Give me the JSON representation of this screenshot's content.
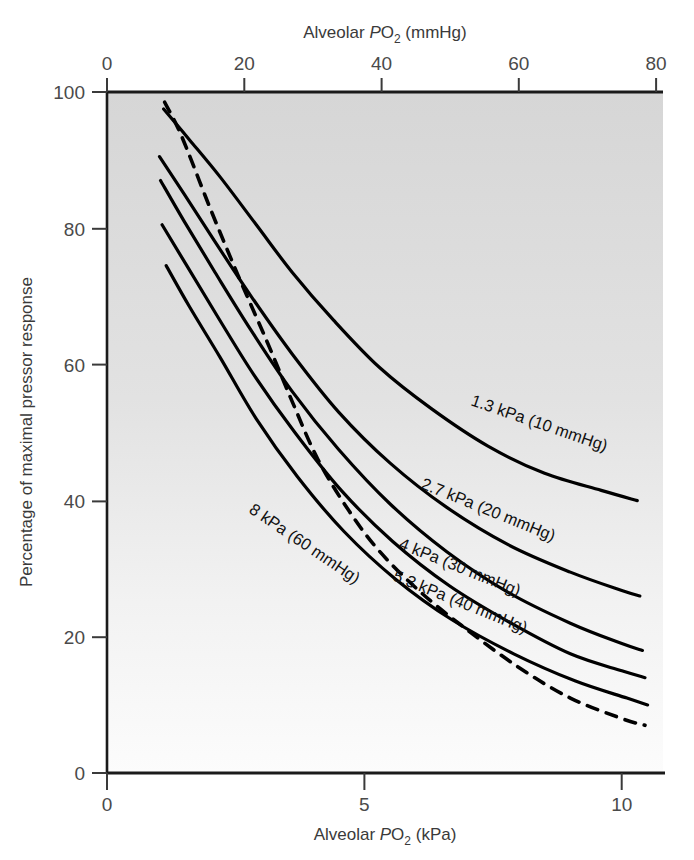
{
  "figure": {
    "name": "hypoxic-pulmonary-vasoconstriction-chart",
    "background": "#ffffff",
    "plot_fill_top": "#d8d8d8",
    "plot_fill_bottom": "#fafafa",
    "line_color": "#000000"
  },
  "axes": {
    "top": {
      "title_prefix": "Alveolar ",
      "title_italic": "P",
      "title_sub": "O",
      "title_sub2": "2",
      "title_suffix": " (mmHg)",
      "title_full": "Alveolar PO2 (mmHg)",
      "ticks": [
        "0",
        "20",
        "40",
        "60",
        "80"
      ],
      "tick_values": [
        0,
        20,
        40,
        60,
        80
      ],
      "range": [
        0,
        81
      ]
    },
    "bottom": {
      "title_prefix": "Alveolar ",
      "title_italic": "P",
      "title_sub": "O",
      "title_sub2": "2",
      "title_suffix": " (kPa)",
      "title_full": "Alveolar PO2 (kPa)",
      "ticks": [
        "0",
        "5",
        "10"
      ],
      "tick_values": [
        0,
        5,
        10
      ],
      "range": [
        0,
        10.8
      ]
    },
    "left": {
      "title": "Percentage of maximal pressor response",
      "ticks": [
        "0",
        "20",
        "40",
        "60",
        "80",
        "100"
      ],
      "tick_values": [
        0,
        20,
        40,
        60,
        80,
        100
      ],
      "range": [
        0,
        100
      ]
    }
  },
  "chart_data": {
    "type": "line",
    "title": "",
    "xlabel": "Alveolar PO2 (kPa)",
    "ylabel": "Percentage of maximal pressor response",
    "xlim": [
      0,
      10.8
    ],
    "ylim": [
      0,
      100
    ],
    "x2label": "Alveolar PO2 (mmHg)",
    "x2lim": [
      0,
      81
    ],
    "grid": false,
    "legend": "inline-curve-labels",
    "series": [
      {
        "name": "1.3 kPa (10 mmHg)",
        "label": "1.3 kPa (10 mmHg)",
        "style": "solid",
        "points": [
          [
            1.1,
            97.5
          ],
          [
            1.6,
            93.0
          ],
          [
            2.2,
            87.5
          ],
          [
            2.9,
            80.5
          ],
          [
            3.6,
            73.5
          ],
          [
            4.4,
            66.5
          ],
          [
            5.3,
            59.5
          ],
          [
            6.3,
            53.5
          ],
          [
            7.4,
            48.0
          ],
          [
            8.5,
            44.0
          ],
          [
            9.6,
            41.5
          ],
          [
            10.3,
            40.0
          ]
        ]
      },
      {
        "name": "2.7 kPa (20 mmHg)",
        "label": "2.7 kPa (20 mmHg)",
        "style": "solid",
        "points": [
          [
            1.02,
            90.5
          ],
          [
            1.5,
            85.0
          ],
          [
            2.1,
            78.0
          ],
          [
            2.8,
            70.0
          ],
          [
            3.6,
            61.5
          ],
          [
            4.5,
            53.0
          ],
          [
            5.5,
            45.5
          ],
          [
            6.6,
            39.0
          ],
          [
            7.8,
            33.5
          ],
          [
            9.0,
            29.5
          ],
          [
            10.0,
            26.8
          ],
          [
            10.35,
            26.0
          ]
        ]
      },
      {
        "name": "4 kPa (30 mmHg)",
        "label": "4 kPa (30 mmHg)",
        "style": "solid",
        "points": [
          [
            1.04,
            87.0
          ],
          [
            1.5,
            81.0
          ],
          [
            2.1,
            73.5
          ],
          [
            2.8,
            65.0
          ],
          [
            3.6,
            56.0
          ],
          [
            4.5,
            47.5
          ],
          [
            5.5,
            39.5
          ],
          [
            6.6,
            32.5
          ],
          [
            7.8,
            26.5
          ],
          [
            9.0,
            22.0
          ],
          [
            10.0,
            19.0
          ],
          [
            10.4,
            18.0
          ]
        ]
      },
      {
        "name": "5.3 kPa (40 mmHg)",
        "label": "5.3 kPa (40 mmHg)",
        "style": "solid",
        "points": [
          [
            1.07,
            80.5
          ],
          [
            1.55,
            74.5
          ],
          [
            2.15,
            67.0
          ],
          [
            2.85,
            58.5
          ],
          [
            3.65,
            50.0
          ],
          [
            4.55,
            41.5
          ],
          [
            5.55,
            34.0
          ],
          [
            6.65,
            27.5
          ],
          [
            7.85,
            22.0
          ],
          [
            9.0,
            17.5
          ],
          [
            10.0,
            15.0
          ],
          [
            10.45,
            14.0
          ]
        ]
      },
      {
        "name": "8 kPa (60 mmHg)",
        "label": "8 kPa (60 mmHg)",
        "style": "solid",
        "points": [
          [
            1.15,
            74.5
          ],
          [
            1.6,
            68.5
          ],
          [
            2.2,
            61.0
          ],
          [
            2.9,
            52.0
          ],
          [
            3.7,
            43.5
          ],
          [
            4.6,
            35.5
          ],
          [
            5.6,
            28.5
          ],
          [
            6.7,
            22.5
          ],
          [
            7.9,
            17.5
          ],
          [
            9.1,
            13.5
          ],
          [
            10.1,
            11.0
          ],
          [
            10.5,
            10.0
          ]
        ]
      },
      {
        "name": "dashed-reference",
        "label": "",
        "style": "dashed",
        "points": [
          [
            1.12,
            98.5
          ],
          [
            1.45,
            93.5
          ],
          [
            2.0,
            83.0
          ],
          [
            2.55,
            73.0
          ],
          [
            3.1,
            63.5
          ],
          [
            3.6,
            54.5
          ],
          [
            4.1,
            46.0
          ],
          [
            4.7,
            38.5
          ],
          [
            5.3,
            32.5
          ],
          [
            6.1,
            26.5
          ],
          [
            7.0,
            21.0
          ],
          [
            8.0,
            15.5
          ],
          [
            9.0,
            11.0
          ],
          [
            10.0,
            8.0
          ],
          [
            10.45,
            7.0
          ]
        ]
      }
    ]
  },
  "curve_labels": [
    {
      "id": "label-1-3-kpa",
      "text": "1.3 kPa (10 mmHg)",
      "x": 470,
      "y": 405,
      "angle": 19
    },
    {
      "id": "label-2-7-kpa",
      "text": "2.7 kPa (20 mmHg)",
      "x": 420,
      "y": 488,
      "angle": 22
    },
    {
      "id": "label-4-kpa",
      "text": "4 kPa (30 mmHg)",
      "x": 398,
      "y": 548,
      "angle": 22
    },
    {
      "id": "label-5-3-kpa",
      "text": "5.3 kPa (40 mmHg)",
      "x": 392,
      "y": 580,
      "angle": 22
    },
    {
      "id": "label-8-kpa",
      "text": "8 kPa (60 mmHg)",
      "x": 248,
      "y": 512,
      "angle": 34
    }
  ]
}
